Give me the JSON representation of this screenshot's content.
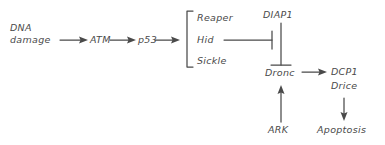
{
  "diagram": {
    "type": "flow-diagram",
    "style": "hand-drawn",
    "background_color": "#ffffff",
    "ink_color": "#4a4a4a",
    "nodes": [
      {
        "id": "dna_damage",
        "label_line1": "DNA",
        "label_line2": "damage"
      },
      {
        "id": "atm",
        "label": "ATM"
      },
      {
        "id": "p53",
        "label": "p53"
      },
      {
        "id": "reaper",
        "label": "Reaper"
      },
      {
        "id": "hid",
        "label": "Hid"
      },
      {
        "id": "sickle",
        "label": "Sickle"
      },
      {
        "id": "diap1",
        "label": "DIAP1"
      },
      {
        "id": "dronc",
        "label": "Dronc"
      },
      {
        "id": "dcp1",
        "label": "DCP1"
      },
      {
        "id": "drice",
        "label": "Drice"
      },
      {
        "id": "ark",
        "label": "ARK"
      },
      {
        "id": "apoptosis",
        "label": "Apoptosis"
      }
    ],
    "edges": [
      {
        "from": "dna_damage",
        "to": "atm",
        "kind": "activation"
      },
      {
        "from": "atm",
        "to": "p53",
        "kind": "activation"
      },
      {
        "from": "p53",
        "to": "rhs_group",
        "kind": "activation"
      },
      {
        "from": "hid",
        "to": "diap1",
        "kind": "inhibition"
      },
      {
        "from": "diap1",
        "to": "dronc",
        "kind": "inhibition"
      },
      {
        "from": "ark",
        "to": "dronc",
        "kind": "activation"
      },
      {
        "from": "dronc",
        "to": "dcp1",
        "kind": "activation"
      },
      {
        "from": "dcp1",
        "to": "apoptosis",
        "kind": "activation"
      }
    ],
    "groups": [
      {
        "id": "rhs_group",
        "members": [
          "reaper",
          "hid",
          "sickle"
        ],
        "bracket": "left-square"
      }
    ]
  }
}
